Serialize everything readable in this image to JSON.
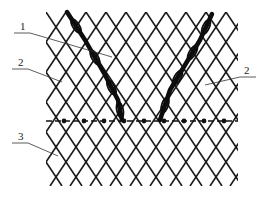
{
  "figure": {
    "type": "netting-structure-schematic",
    "mesh": {
      "x_min": 46,
      "x_max": 238,
      "y_min": 12,
      "y_max": 186,
      "cell_width": 20,
      "cell_height": 30,
      "stroke_color": "#1a1a1a"
    },
    "reinforcing_strands": [
      {
        "id": "strand-left",
        "points": [
          [
            67,
            12
          ],
          [
            85,
            40
          ],
          [
            105,
            75
          ],
          [
            118,
            100
          ],
          [
            122,
            120
          ]
        ]
      },
      {
        "id": "strand-right",
        "points": [
          [
            212,
            14
          ],
          [
            200,
            40
          ],
          [
            185,
            65
          ],
          [
            170,
            90
          ],
          [
            160,
            120
          ]
        ]
      }
    ],
    "dashed_line": {
      "y": 121,
      "x_start": 46,
      "x_end": 238
    },
    "labels": [
      {
        "id": "1",
        "text": "1",
        "x": 20,
        "y": 30,
        "leader_to": [
          112,
          57
        ]
      },
      {
        "id": "2-left",
        "text": "2",
        "x": 18,
        "y": 66,
        "leader_to": [
          62,
          82
        ]
      },
      {
        "id": "2-right",
        "text": "2",
        "x": 244,
        "y": 74,
        "leader_to": [
          205,
          85
        ]
      },
      {
        "id": "3",
        "text": "3",
        "x": 18,
        "y": 140,
        "leader_to": [
          58,
          156
        ]
      }
    ]
  }
}
